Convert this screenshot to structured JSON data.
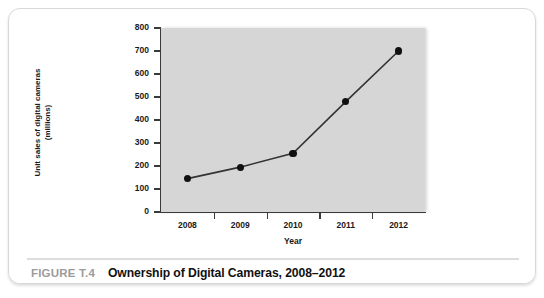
{
  "figure": {
    "number_label": "FIGURE T.4",
    "title": "Ownership of Digital Cameras, 2008–2012"
  },
  "colors": {
    "plot_background": "#d6d6d6",
    "card_background": "#ffffff",
    "line": "#333333",
    "marker": "#101010",
    "axis": "#3a3a3a",
    "figure_number": "#9b9b9b",
    "figure_title": "#111111"
  },
  "chart_data": {
    "type": "line",
    "title": "Ownership of Digital Cameras, 2008–2012",
    "xlabel": "Year",
    "ylabel": "Unit sales of digital cameras (millions)",
    "ylabel_line1": "Unit sales of digital cameras",
    "ylabel_line2": "(millions)",
    "categories": [
      "2008",
      "2009",
      "2010",
      "2011",
      "2012"
    ],
    "x": [
      2008,
      2009,
      2010,
      2011,
      2012
    ],
    "values": [
      145,
      195,
      255,
      480,
      700
    ],
    "ylim": [
      0,
      800
    ],
    "yticks": [
      0,
      100,
      200,
      300,
      400,
      500,
      600,
      700,
      800
    ],
    "ytick_labels": [
      "0",
      "100",
      "200",
      "300",
      "400",
      "500",
      "600",
      "700",
      "800"
    ],
    "xtick_labels": [
      "2008",
      "2009",
      "2010",
      "2011",
      "2012"
    ],
    "grid": false,
    "legend": null,
    "marker": "filled-circle",
    "series": [
      {
        "name": "Unit sales of digital cameras (millions)",
        "values": [
          145,
          195,
          255,
          480,
          700
        ]
      }
    ]
  }
}
